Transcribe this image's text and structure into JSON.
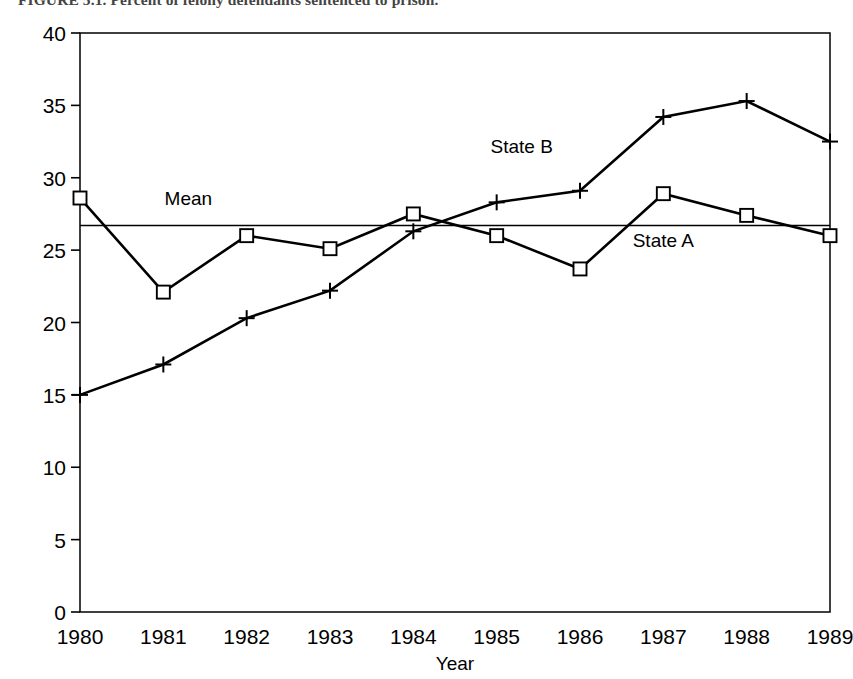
{
  "figure": {
    "caption": "FIGURE 5.1. Percent of felony defendants sentenced to prison."
  },
  "chart_data": {
    "type": "line",
    "title": "Percent of felony defendants sentenced to prison",
    "xlabel": "Year",
    "ylabel": "",
    "x": [
      1980,
      1981,
      1982,
      1983,
      1984,
      1985,
      1986,
      1987,
      1988,
      1989
    ],
    "categories": [
      "1980",
      "1981",
      "1982",
      "1983",
      "1984",
      "1985",
      "1986",
      "1987",
      "1988",
      "1989"
    ],
    "series": [
      {
        "name": "State A",
        "marker": "square",
        "values": [
          28.6,
          22.1,
          26.0,
          25.1,
          27.5,
          26.0,
          23.7,
          28.9,
          27.4,
          26.0
        ]
      },
      {
        "name": "State B",
        "marker": "plus",
        "values": [
          15.0,
          17.1,
          20.3,
          22.2,
          26.3,
          28.3,
          29.1,
          34.2,
          35.3,
          32.5
        ]
      }
    ],
    "reference_lines": [
      {
        "label": "Mean",
        "value": 26.7,
        "orientation": "horizontal"
      }
    ],
    "annotations": [
      {
        "text": "State A",
        "x": 1987.0,
        "y": 25.2
      },
      {
        "text": "State B",
        "x": 1985.3,
        "y": 31.7
      },
      {
        "text": "Mean",
        "x": 1981.3,
        "y": 28.1
      }
    ],
    "xlim": [
      1980,
      1989
    ],
    "ylim": [
      0,
      40
    ],
    "yticks": [
      0,
      5,
      10,
      15,
      20,
      25,
      30,
      35,
      40
    ],
    "ytick_labels": [
      "0",
      "5",
      "10",
      "15",
      "20",
      "25",
      "30",
      "35",
      "40"
    ],
    "xticks": [
      1980,
      1981,
      1982,
      1983,
      1984,
      1985,
      1986,
      1987,
      1988,
      1989
    ],
    "grid": false,
    "legend_position": "inline-annotations",
    "line_color": "#000000",
    "background_color": "#ffffff"
  }
}
